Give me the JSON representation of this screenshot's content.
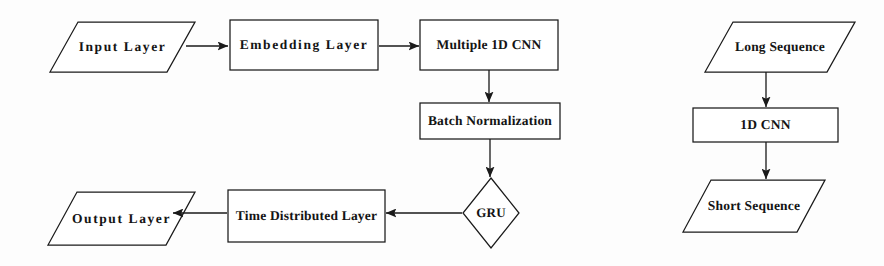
{
  "diagram": {
    "background_color": "#fdfdfd",
    "stroke_color": "#1a1a1a",
    "text_color": "#141414",
    "left_flow": {
      "name": "main-model-flow",
      "nodes": [
        {
          "id": "input-layer",
          "label": "Input Layer",
          "shape": "parallelogram",
          "x": 50,
          "y": 22,
          "w": 145,
          "h": 50
        },
        {
          "id": "embedding-layer",
          "label": "Embedding Layer",
          "shape": "rectangle",
          "x": 230,
          "y": 20,
          "w": 148,
          "h": 50
        },
        {
          "id": "multiple-1d-cnn",
          "label": "Multiple 1D CNN",
          "shape": "rectangle",
          "x": 420,
          "y": 20,
          "w": 138,
          "h": 50
        },
        {
          "id": "batch-normalization",
          "label": "Batch Normalization",
          "shape": "rectangle",
          "x": 420,
          "y": 103,
          "w": 140,
          "h": 36
        },
        {
          "id": "gru",
          "label": "GRU",
          "shape": "diamond",
          "x": 463,
          "y": 178,
          "w": 56,
          "h": 70
        },
        {
          "id": "time-distributed-layer",
          "label": "Time Distributed Layer",
          "shape": "rectangle",
          "x": 228,
          "y": 190,
          "w": 157,
          "h": 52
        },
        {
          "id": "output-layer",
          "label": "Output Layer",
          "shape": "parallelogram",
          "x": 48,
          "y": 192,
          "w": 147,
          "h": 53
        }
      ],
      "edges": [
        {
          "id": "edge-input-to-embedding",
          "from": "input-layer",
          "to": "embedding-layer",
          "direction": "right"
        },
        {
          "id": "edge-embedding-to-cnn",
          "from": "embedding-layer",
          "to": "multiple-1d-cnn",
          "direction": "right"
        },
        {
          "id": "edge-cnn-to-batchnorm",
          "from": "multiple-1d-cnn",
          "to": "batch-normalization",
          "direction": "down"
        },
        {
          "id": "edge-batchnorm-to-gru",
          "from": "batch-normalization",
          "to": "gru",
          "direction": "down"
        },
        {
          "id": "edge-gru-to-timedistributed",
          "from": "gru",
          "to": "time-distributed-layer",
          "direction": "left"
        },
        {
          "id": "edge-timedistributed-to-output",
          "from": "time-distributed-layer",
          "to": "output-layer",
          "direction": "left"
        }
      ]
    },
    "right_flow": {
      "name": "sequence-reduction-flow",
      "nodes": [
        {
          "id": "long-sequence",
          "label": "Long Sequence",
          "shape": "parallelogram",
          "x": 705,
          "y": 22,
          "w": 150,
          "h": 50
        },
        {
          "id": "one-d-cnn",
          "label": "1D CNN",
          "shape": "rectangle",
          "x": 693,
          "y": 108,
          "w": 145,
          "h": 34
        },
        {
          "id": "short-sequence",
          "label": "Short Sequence",
          "shape": "parallelogram",
          "x": 683,
          "y": 180,
          "w": 142,
          "h": 52
        }
      ],
      "edges": [
        {
          "id": "edge-longseq-to-cnn",
          "from": "long-sequence",
          "to": "one-d-cnn",
          "direction": "down"
        },
        {
          "id": "edge-cnn-to-shortseq",
          "from": "one-d-cnn",
          "to": "short-sequence",
          "direction": "down"
        }
      ]
    }
  }
}
